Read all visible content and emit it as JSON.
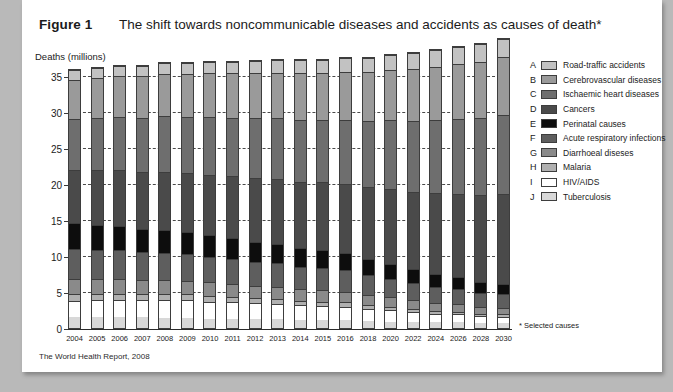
{
  "figure": {
    "label": "Figure 1",
    "title": "The shift towards noncommunicable diseases and accidents as causes of death*",
    "source": "The World Health Report, 2008",
    "footnote": "* Selected causes"
  },
  "legend": {
    "items": [
      {
        "letter": "A",
        "label": "Road-traffic accidents",
        "color": "#c2c2c2"
      },
      {
        "letter": "B",
        "label": "Cerebrovascular diseases",
        "color": "#9a9a9a"
      },
      {
        "letter": "C",
        "label": "Ischaemic heart diseases",
        "color": "#6e6e6e"
      },
      {
        "letter": "D",
        "label": "Cancers",
        "color": "#4a4a4a"
      },
      {
        "letter": "E",
        "label": "Perinatal causes",
        "color": "#0d0d0d"
      },
      {
        "letter": "F",
        "label": "Acute respiratory infections",
        "color": "#5e5e5e"
      },
      {
        "letter": "G",
        "label": "Diarrhoeal diseses",
        "color": "#8a8a8a"
      },
      {
        "letter": "H",
        "label": "Malaria",
        "color": "#b0b0b0"
      },
      {
        "letter": "I",
        "label": "HIV/AIDS",
        "color": "#ffffff"
      },
      {
        "letter": "J",
        "label": "Tuberculosis",
        "color": "#d8d8d8"
      }
    ]
  },
  "chart_data": {
    "type": "bar",
    "stacked": true,
    "title": "The shift towards noncommunicable diseases and accidents as causes of death*",
    "xlabel": "",
    "ylabel": "Deaths (millions)",
    "ylim": [
      0,
      37
    ],
    "yticks": [
      0,
      5,
      10,
      15,
      20,
      25,
      30,
      35
    ],
    "grid": true,
    "legend_position": "right",
    "categories": [
      "2004",
      "2005",
      "2006",
      "2007",
      "2008",
      "2009",
      "2010",
      "2011",
      "2012",
      "2013",
      "2014",
      "2015",
      "2016",
      "2018",
      "2020",
      "2022",
      "2024",
      "2026",
      "2028",
      "2030"
    ],
    "stack_order_bottom_to_top": [
      "Tuberculosis",
      "HIV/AIDS",
      "Malaria",
      "Diarrhoeal diseses",
      "Acute respiratory infections",
      "Perinatal causes",
      "Cancers",
      "Ischaemic heart diseases",
      "Cerebrovascular diseases",
      "Road-traffic accidents"
    ],
    "series": [
      {
        "name": "Tuberculosis",
        "letter": "J",
        "color": "#d8d8d8",
        "values": [
          1.6,
          1.6,
          1.5,
          1.5,
          1.4,
          1.4,
          1.3,
          1.3,
          1.2,
          1.2,
          1.1,
          1.1,
          1.1,
          1.0,
          0.9,
          0.9,
          0.8,
          0.8,
          0.7,
          0.7
        ]
      },
      {
        "name": "HIV/AIDS",
        "letter": "I",
        "color": "#ffffff",
        "values": [
          2.2,
          2.3,
          2.4,
          2.4,
          2.5,
          2.5,
          2.4,
          2.4,
          2.3,
          2.2,
          2.1,
          2.0,
          1.9,
          1.7,
          1.6,
          1.4,
          1.2,
          1.1,
          1.0,
          0.9
        ]
      },
      {
        "name": "Malaria",
        "letter": "H",
        "color": "#b0b0b0",
        "values": [
          0.9,
          0.9,
          0.9,
          0.8,
          0.8,
          0.8,
          0.8,
          0.7,
          0.7,
          0.7,
          0.6,
          0.6,
          0.6,
          0.5,
          0.5,
          0.4,
          0.4,
          0.4,
          0.3,
          0.3
        ]
      },
      {
        "name": "Diarrhoeal diseses",
        "letter": "G",
        "color": "#8a8a8a",
        "values": [
          2.2,
          2.1,
          2.1,
          2.0,
          2.0,
          1.9,
          1.9,
          1.8,
          1.7,
          1.7,
          1.6,
          1.6,
          1.5,
          1.4,
          1.3,
          1.2,
          1.1,
          1.0,
          0.9,
          0.9
        ]
      },
      {
        "name": "Acute respiratory infections",
        "letter": "F",
        "color": "#5e5e5e",
        "values": [
          4.2,
          4.1,
          4.0,
          3.9,
          3.8,
          3.7,
          3.6,
          3.5,
          3.4,
          3.3,
          3.2,
          3.1,
          3.0,
          2.8,
          2.6,
          2.4,
          2.3,
          2.1,
          2.0,
          1.9
        ]
      },
      {
        "name": "Perinatal causes",
        "letter": "E",
        "color": "#0d0d0d",
        "values": [
          3.6,
          3.5,
          3.4,
          3.3,
          3.2,
          3.1,
          3.0,
          2.9,
          2.8,
          2.7,
          2.6,
          2.5,
          2.4,
          2.2,
          2.1,
          1.9,
          1.8,
          1.7,
          1.6,
          1.5
        ]
      },
      {
        "name": "Cancers",
        "letter": "D",
        "color": "#4a4a4a",
        "values": [
          7.4,
          7.6,
          7.8,
          8.0,
          8.2,
          8.3,
          8.5,
          8.7,
          8.9,
          9.1,
          9.3,
          9.5,
          9.7,
          10.1,
          10.5,
          10.9,
          11.3,
          11.7,
          12.1,
          12.5
        ]
      },
      {
        "name": "Ischaemic heart diseases",
        "letter": "C",
        "color": "#6e6e6e",
        "values": [
          7.2,
          7.4,
          7.5,
          7.6,
          7.8,
          7.9,
          8.1,
          8.2,
          8.4,
          8.5,
          8.7,
          8.8,
          9.0,
          9.3,
          9.6,
          9.9,
          10.2,
          10.5,
          10.8,
          11.1
        ]
      },
      {
        "name": "Cerebrovascular diseases",
        "letter": "B",
        "color": "#9a9a9a",
        "values": [
          5.5,
          5.6,
          5.7,
          5.8,
          5.9,
          6.0,
          6.1,
          6.2,
          6.3,
          6.4,
          6.5,
          6.6,
          6.7,
          6.9,
          7.1,
          7.3,
          7.5,
          7.7,
          7.9,
          8.1
        ]
      },
      {
        "name": "Road-traffic accidents",
        "letter": "A",
        "color": "#c2c2c2",
        "values": [
          1.3,
          1.3,
          1.4,
          1.4,
          1.5,
          1.5,
          1.6,
          1.6,
          1.7,
          1.7,
          1.8,
          1.8,
          1.9,
          2.0,
          2.1,
          2.2,
          2.3,
          2.4,
          2.5,
          2.6
        ]
      }
    ],
    "totals": [
      36.1,
      36.4,
      36.7,
      36.7,
      37.1,
      37.1,
      37.3,
      37.3,
      37.4,
      37.5,
      37.5,
      37.6,
      37.8,
      37.9,
      38.3,
      38.5,
      38.9,
      39.4,
      39.8,
      40.5
    ]
  }
}
